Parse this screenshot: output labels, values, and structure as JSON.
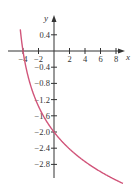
{
  "chart_data": {
    "type": "line",
    "title": "",
    "xlabel": "x",
    "ylabel": "y",
    "x_ticks": [
      -4,
      -2,
      2,
      4,
      6,
      8
    ],
    "x_tick_labels": [
      "-4",
      "-2",
      "2",
      "4",
      "6",
      "8"
    ],
    "y_ticks": [
      0.4,
      -0.4,
      -0.8,
      -1.2,
      -1.6,
      -2.0,
      -2.4,
      -2.8
    ],
    "y_tick_labels": [
      "0.4",
      "-0.4",
      "-0.8",
      "-1.2",
      "-1.6",
      "-2.0",
      "-2.4",
      "-2.8"
    ],
    "xlim": [
      -5,
      10
    ],
    "ylim": [
      -3.2,
      0.8
    ],
    "grid": false,
    "legend": null,
    "series": [
      {
        "name": "curve",
        "color": "#d1557a",
        "x": [
          -4.0,
          -3.5,
          -3.0,
          -2.0,
          -1.0,
          0.0,
          1.0,
          2.0,
          3.0,
          4.0,
          5.0,
          6.0,
          7.0,
          8.0,
          9.0
        ],
        "y": [
          0.0,
          -0.5,
          -0.86,
          -1.37,
          -1.73,
          -2.0,
          -2.23,
          -2.42,
          -2.58,
          -2.73,
          -2.86,
          -2.98,
          -3.09,
          -3.19,
          -3.28
        ]
      }
    ],
    "annotations": []
  },
  "colors": {
    "axis": "#333333",
    "curve": "#d1557a"
  }
}
